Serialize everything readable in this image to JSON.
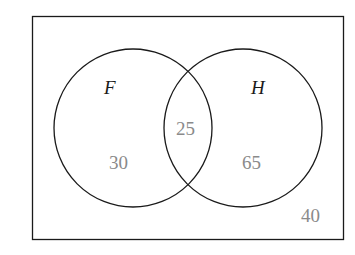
{
  "diagram": {
    "type": "venn",
    "universe": {
      "value": "40"
    },
    "sets": [
      {
        "name": "F",
        "only_value": "30"
      },
      {
        "name": "H",
        "only_value": "65"
      }
    ],
    "intersection": {
      "value": "25"
    }
  },
  "colors": {
    "outline": "#1a1a1a",
    "numbers": "#8a8a8a",
    "background": "#ffffff"
  }
}
